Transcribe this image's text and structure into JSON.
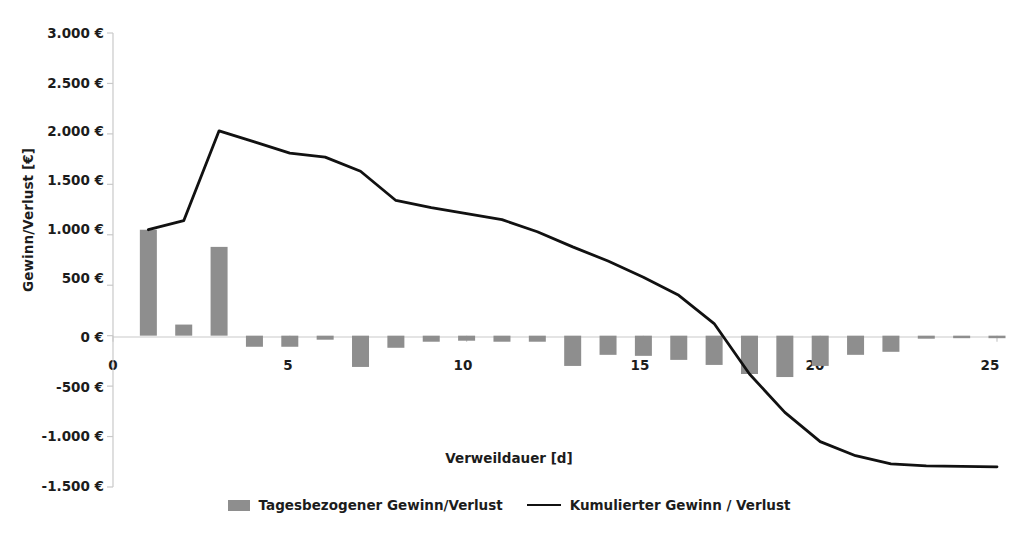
{
  "chart_data": {
    "type": "bar",
    "title": "",
    "xlabel": "Verweildauer [d]",
    "ylabel": "Gewinn/Verlust [€]",
    "xlim": [
      0,
      25
    ],
    "ylim": [
      -1500,
      3000
    ],
    "xticks": [
      0,
      5,
      10,
      15,
      20,
      25
    ],
    "xtick_labels": [
      "0",
      "5",
      "10",
      "15",
      "20",
      "25"
    ],
    "yticks": [
      3000,
      2500,
      2000,
      1500,
      1000,
      500,
      0,
      -500,
      -1000,
      -1500
    ],
    "ytick_labels": [
      "3.000 €",
      "2.500 €",
      "2.000 €",
      "1.500 €",
      "1.000 €",
      "500 €",
      "0 €",
      "-500 €",
      "-1.000 €",
      "-1.500 €"
    ],
    "grid": false,
    "legend_position": "bottom",
    "categories": [
      1,
      2,
      3,
      4,
      5,
      6,
      7,
      8,
      9,
      10,
      11,
      12,
      13,
      14,
      15,
      16,
      17,
      18,
      19,
      20,
      21,
      22,
      23,
      24,
      25
    ],
    "series": [
      {
        "name": "Tagesbezogener Gewinn/Verlust",
        "type": "bar",
        "color": "#8e8e8e",
        "values": [
          1050,
          110,
          880,
          -110,
          -110,
          -40,
          -310,
          -120,
          -60,
          -50,
          -60,
          -60,
          -300,
          -190,
          -200,
          -240,
          -290,
          -380,
          -410,
          -300,
          -190,
          -160,
          -30,
          -25,
          -25
        ]
      },
      {
        "name": "Kumulierter Gewinn / Verlust",
        "type": "line",
        "color": "#111111",
        "values": [
          1050,
          1140,
          2030,
          1920,
          1810,
          1770,
          1630,
          1340,
          1270,
          1210,
          1150,
          1030,
          880,
          740,
          580,
          400,
          120,
          -380,
          -760,
          -1050,
          -1190,
          -1270,
          -1290,
          -1295,
          -1300
        ]
      }
    ]
  },
  "legend": {
    "items": [
      {
        "label": "Tagesbezogener Gewinn/Verlust",
        "marker": "bar-swatch"
      },
      {
        "label": "Kumulierter Gewinn / Verlust",
        "marker": "line-swatch"
      }
    ]
  },
  "colors": {
    "bar": "#8e8e8e",
    "line": "#111111",
    "axis": "#bdbdbd",
    "text": "#1c1c1c",
    "background": "#ffffff"
  }
}
